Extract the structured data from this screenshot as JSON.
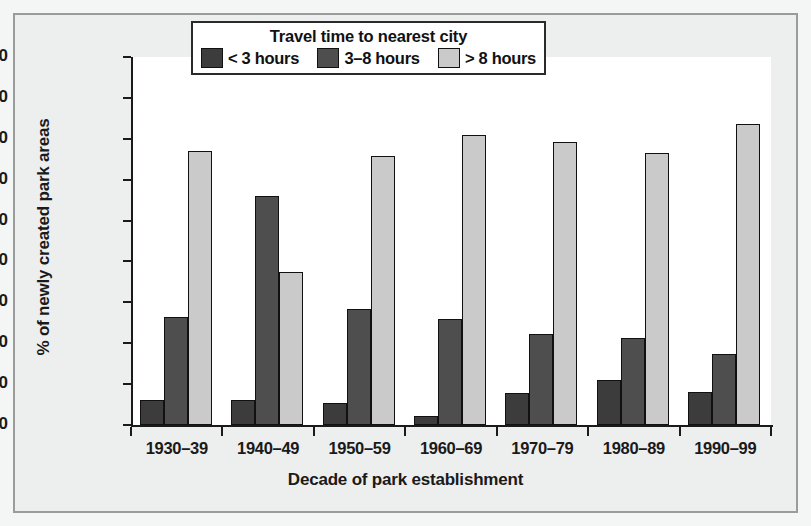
{
  "chart_data": {
    "type": "bar",
    "title": "",
    "xlabel": "Decade of park establishment",
    "ylabel": "% of newly created park areas",
    "categories": [
      "1930–39",
      "1940–49",
      "1950–59",
      "1960–69",
      "1970–79",
      "1980–89",
      "1990–99"
    ],
    "series": [
      {
        "name": "< 3 hours",
        "color": "#3c3c3c",
        "values": [
          6.2,
          6.1,
          5.3,
          2.2,
          7.8,
          11.1,
          8.0
        ]
      },
      {
        "name": "3–8 hours",
        "color": "#4e4e4e",
        "values": [
          26.5,
          56.0,
          28.4,
          26.0,
          22.2,
          21.3,
          17.3
        ]
      },
      {
        "name": "> 8 hours",
        "color": "#c9cac9",
        "values": [
          67.0,
          37.5,
          65.8,
          70.9,
          69.3,
          66.5,
          73.5
        ]
      }
    ],
    "ylim": [
      0,
      90
    ],
    "yticks": [
      0,
      10,
      20,
      30,
      40,
      50,
      60,
      70,
      80,
      90
    ],
    "ytick_labels": [
      "0",
      "10",
      "20",
      "30",
      "40",
      "50",
      "60",
      "70",
      "80",
      "90"
    ],
    "grid": false,
    "legend_position": "top-center",
    "legend_title": "Travel time to nearest city"
  },
  "colors": {
    "series_dark": "#3c3c3c",
    "series_mid": "#4e4e4e",
    "series_light": "#c9cac9",
    "frame": "#9a9c9c",
    "background": "#edeeee",
    "plot_background": "#ffffff",
    "axis": "#1a1a1a"
  }
}
